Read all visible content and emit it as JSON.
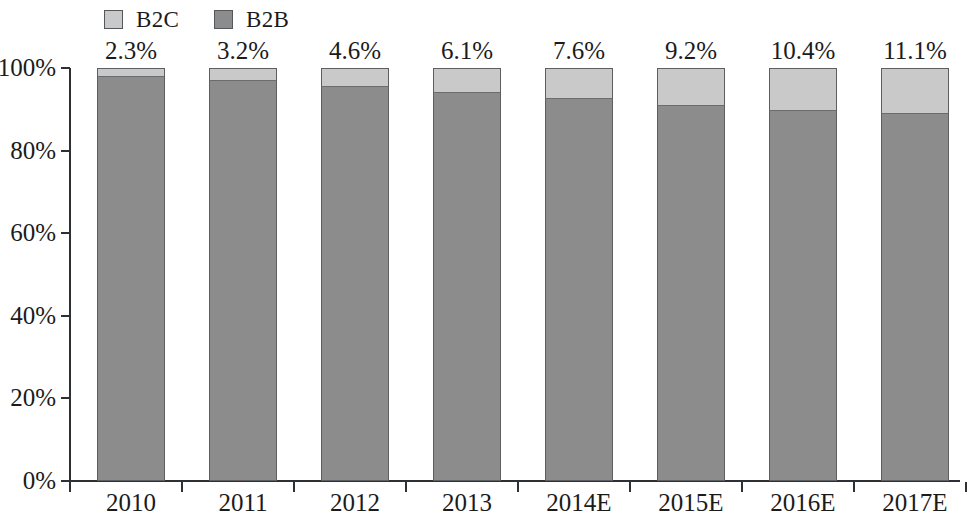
{
  "legend": {
    "entries": [
      {
        "label": "B2C",
        "color": "#c9c9c9"
      },
      {
        "label": "B2B",
        "color": "#8c8c8c"
      }
    ]
  },
  "axes": {
    "y_tick_labels": [
      "100%",
      "80%",
      "60%",
      "40%",
      "20%",
      "0%"
    ],
    "x_tick_labels": [
      "2010",
      "2011",
      "2012",
      "2013",
      "2014E",
      "2015E",
      "2016E",
      "2017E"
    ]
  },
  "bar_labels": [
    "2.3%",
    "3.2%",
    "4.6%",
    "6.1%",
    "7.6%",
    "9.2%",
    "10.4%",
    "11.1%"
  ],
  "chart_data": {
    "type": "bar",
    "subtype": "100% stacked column",
    "title": "",
    "subtitle": "",
    "xlabel": "",
    "ylabel": "",
    "ylim": [
      0,
      100
    ],
    "yticks": [
      0,
      20,
      40,
      60,
      80,
      100
    ],
    "ytick_labels": [
      "0%",
      "20%",
      "40%",
      "60%",
      "80%",
      "100%"
    ],
    "grid": false,
    "legend_position": "top-left",
    "categories": [
      "2010",
      "2011",
      "2012",
      "2013",
      "2014E",
      "2015E",
      "2016E",
      "2017E"
    ],
    "series": [
      {
        "name": "B2C",
        "color": "#c9c9c9",
        "values": [
          2.3,
          3.2,
          4.6,
          6.1,
          7.6,
          9.2,
          10.4,
          11.1
        ],
        "data_labels": [
          "2.3%",
          "3.2%",
          "4.6%",
          "6.1%",
          "7.6%",
          "9.2%",
          "10.4%",
          "11.1%"
        ]
      },
      {
        "name": "B2B",
        "color": "#8c8c8c",
        "values": [
          97.7,
          96.8,
          95.4,
          93.9,
          92.4,
          90.8,
          89.6,
          88.9
        ],
        "data_labels": []
      }
    ]
  }
}
